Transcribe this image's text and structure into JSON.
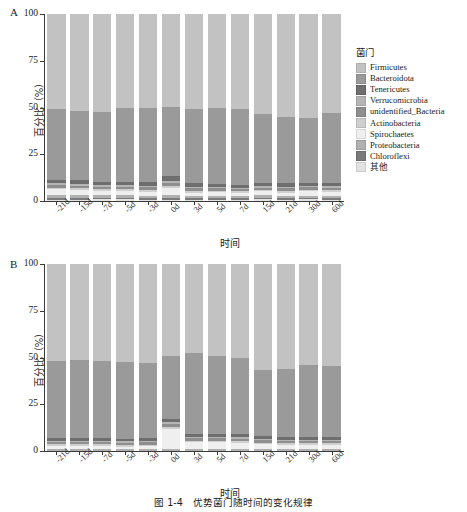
{
  "figure": {
    "caption": "图 1-4　优势菌门随时间的变化规律",
    "legend_title": "菌门"
  },
  "axes": {
    "ylabel": "百分比（%）",
    "xlabel": "时间",
    "yticks": [
      "0",
      "25",
      "50",
      "75",
      "100"
    ],
    "ylim": [
      0,
      100
    ]
  },
  "panels": [
    {
      "letter": "A"
    },
    {
      "letter": "B"
    }
  ],
  "colors": {
    "firmicutes": "#c2c2c2",
    "bacteroidota": "#9a9a9a",
    "tenericutes": "#6e6e6e",
    "verrucomicrobia": "#b5b5b5",
    "unidentified_bacteria": "#8e8e8e",
    "actinobacteria": "#cfcfcf",
    "spirochaetes": "#efefef",
    "proteobacteria": "#b0b0b0",
    "chloroflexi": "#7a7a7a",
    "other": "#e2e2e2",
    "axis": "#3a3a3a"
  },
  "chart_data": [
    {
      "type": "bar",
      "panel": "A",
      "stacked": true,
      "title": "",
      "xlabel": "时间",
      "ylabel": "百分比（%）",
      "ylim": [
        0,
        100
      ],
      "grid": false,
      "legend_position": "right",
      "legend_title": "菌门",
      "categories": [
        "-21d",
        "-15d",
        "-7d",
        "-5d",
        "-3d",
        "0d",
        "3d",
        "5d",
        "7d",
        "15d",
        "21d",
        "30d",
        "60d"
      ],
      "series": [
        {
          "name": "Firmicutes",
          "color": "#c2c2c2",
          "values": [
            51.0,
            52.0,
            52.5,
            50.0,
            50.5,
            49.5,
            51.0,
            50.5,
            51.0,
            53.5,
            55.0,
            55.5,
            53.0
          ]
        },
        {
          "name": "Bacteroidota",
          "color": "#9a9a9a",
          "values": [
            38.0,
            36.5,
            37.5,
            40.0,
            39.5,
            37.0,
            39.5,
            40.5,
            40.5,
            37.0,
            35.5,
            35.0,
            37.5
          ]
        },
        {
          "name": "Tenericutes",
          "color": "#6e6e6e",
          "values": [
            1.6,
            2.4,
            1.6,
            1.5,
            1.8,
            2.6,
            1.8,
            1.5,
            1.4,
            1.5,
            1.8,
            1.4,
            1.6
          ]
        },
        {
          "name": "Verrucomicrobia",
          "color": "#b5b5b5",
          "values": [
            0.9,
            1.0,
            0.8,
            0.8,
            0.9,
            1.1,
            0.9,
            0.8,
            0.8,
            0.8,
            0.9,
            0.8,
            0.9
          ]
        },
        {
          "name": "unidentified_Bacteria",
          "color": "#8e8e8e",
          "values": [
            1.3,
            1.4,
            1.2,
            1.2,
            1.3,
            1.6,
            1.3,
            1.2,
            1.2,
            1.2,
            1.3,
            1.2,
            1.3
          ]
        },
        {
          "name": "Actinobacteria",
          "color": "#cfcfcf",
          "values": [
            1.0,
            1.0,
            0.9,
            0.9,
            1.0,
            1.2,
            1.0,
            0.9,
            0.9,
            0.9,
            1.0,
            0.9,
            1.0
          ]
        },
        {
          "name": "Spirochaetes",
          "color": "#efefef",
          "values": [
            3.2,
            2.7,
            2.5,
            2.6,
            2.2,
            4.0,
            1.7,
            1.7,
            1.4,
            2.1,
            1.6,
            2.3,
            2.0
          ]
        },
        {
          "name": "Proteobacteria",
          "color": "#b0b0b0",
          "values": [
            1.4,
            1.4,
            1.3,
            1.3,
            1.4,
            1.5,
            1.3,
            1.3,
            1.2,
            1.3,
            1.3,
            1.3,
            1.3
          ]
        },
        {
          "name": "Chloroflexi",
          "color": "#7a7a7a",
          "values": [
            0.8,
            0.8,
            0.8,
            0.8,
            0.8,
            0.8,
            0.7,
            0.8,
            0.8,
            0.8,
            0.8,
            0.7,
            0.7
          ]
        },
        {
          "name": "其他",
          "color": "#e2e2e2",
          "values": [
            0.8,
            0.8,
            0.9,
            0.9,
            0.6,
            0.7,
            0.8,
            0.8,
            0.8,
            0.9,
            0.8,
            0.9,
            0.7
          ]
        }
      ]
    },
    {
      "type": "bar",
      "panel": "B",
      "stacked": true,
      "title": "",
      "xlabel": "时间",
      "ylabel": "百分比（%）",
      "ylim": [
        0,
        100
      ],
      "grid": false,
      "legend_position": "right",
      "legend_title": "菌门",
      "categories": [
        "-21d",
        "-15d",
        "-7d",
        "-5d",
        "-3d",
        "0d",
        "3d",
        "5d",
        "7d",
        "15d",
        "21d",
        "30d",
        "60d"
      ],
      "series": [
        {
          "name": "Firmicutes",
          "color": "#c2c2c2",
          "values": [
            52.0,
            51.5,
            52.0,
            52.5,
            53.0,
            49.0,
            47.5,
            49.0,
            50.0,
            56.5,
            56.0,
            54.0,
            54.5
          ]
        },
        {
          "name": "Bacteroidota",
          "color": "#9a9a9a",
          "values": [
            41.0,
            41.5,
            41.0,
            41.0,
            40.0,
            34.0,
            43.5,
            42.0,
            41.0,
            35.5,
            36.5,
            38.5,
            38.0
          ]
        },
        {
          "name": "Tenericutes",
          "color": "#6e6e6e",
          "values": [
            1.5,
            1.5,
            1.5,
            1.4,
            1.6,
            1.6,
            1.5,
            1.4,
            1.6,
            1.5,
            1.4,
            1.4,
            1.4
          ]
        },
        {
          "name": "Verrucomicrobia",
          "color": "#b5b5b5",
          "values": [
            0.8,
            0.8,
            0.8,
            0.8,
            0.8,
            1.0,
            0.8,
            0.8,
            0.8,
            0.8,
            0.8,
            0.8,
            0.8
          ]
        },
        {
          "name": "unidentified_Bacteria",
          "color": "#8e8e8e",
          "values": [
            1.2,
            1.2,
            1.2,
            1.2,
            1.2,
            1.5,
            1.2,
            1.2,
            1.2,
            1.2,
            1.2,
            1.2,
            1.2
          ]
        },
        {
          "name": "Actinobacteria",
          "color": "#cfcfcf",
          "values": [
            0.9,
            0.9,
            0.9,
            0.9,
            0.9,
            1.1,
            0.9,
            0.9,
            0.9,
            0.9,
            0.9,
            0.9,
            0.9
          ]
        },
        {
          "name": "Spirochaetes",
          "color": "#efefef",
          "values": [
            1.3,
            1.3,
            1.3,
            1.0,
            1.3,
            10.6,
            3.4,
            3.5,
            3.3,
            2.5,
            2.1,
            2.1,
            2.1
          ]
        },
        {
          "name": "Proteobacteria",
          "color": "#b0b0b0",
          "values": [
            1.3,
            1.3,
            1.3,
            1.2,
            1.2,
            1.2,
            1.2,
            1.2,
            1.2,
            1.1,
            1.1,
            1.1,
            1.1
          ]
        },
        {
          "name": "其他",
          "color": "#e2e2e2",
          "values": [
            0.0,
            0.0,
            0.0,
            0.0,
            0.0,
            0.0,
            0.0,
            0.0,
            0.0,
            0.0,
            0.0,
            0.0,
            0.0
          ]
        }
      ]
    }
  ],
  "legends": {
    "panel_a": {
      "title": "菌门",
      "items": [
        {
          "label": "Firmicutes",
          "color": "#c2c2c2"
        },
        {
          "label": "Bacteroidota",
          "color": "#9a9a9a"
        },
        {
          "label": "Tenericutes",
          "color": "#6e6e6e"
        },
        {
          "label": "Verrucomicrobia",
          "color": "#b5b5b5"
        },
        {
          "label": "unidentified_Bacteria",
          "color": "#8e8e8e"
        },
        {
          "label": "Actinobacteria",
          "color": "#cfcfcf"
        },
        {
          "label": "Spirochaetes",
          "color": "#efefef"
        },
        {
          "label": "Proteobacteria",
          "color": "#b0b0b0"
        },
        {
          "label": "Chloroflexi",
          "color": "#7a7a7a"
        },
        {
          "label": "其他",
          "color": "#e2e2e2"
        }
      ]
    },
    "panel_b": {
      "title": "菌门",
      "items": [
        {
          "label": "Firmicutes",
          "color": "#c2c2c2"
        },
        {
          "label": "Bacteroidota",
          "color": "#9a9a9a"
        },
        {
          "label": "Tenericutes",
          "color": "#6e6e6e"
        },
        {
          "label": "Verrucomicrobia",
          "color": "#b5b5b5"
        },
        {
          "label": "unidentified_Bacteria",
          "color": "#8e8e8e"
        },
        {
          "label": "Actinobacteria",
          "color": "#cfcfcf"
        },
        {
          "label": "Spirochaetes",
          "color": "#efefef"
        },
        {
          "label": "Proteobacteria",
          "color": "#b0b0b0"
        },
        {
          "label": "其他",
          "color": "#e2e2e2"
        }
      ]
    }
  }
}
